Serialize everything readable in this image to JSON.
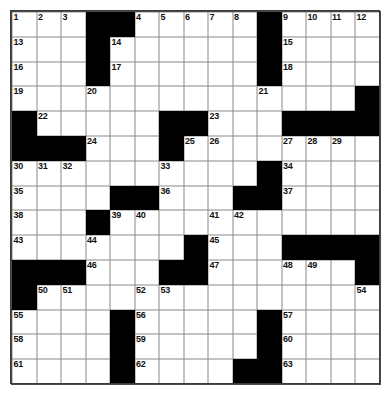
{
  "puzzle": {
    "title": "Crossword Puzzle Grid",
    "rows": 15,
    "cols": 15,
    "block_color": "#000000",
    "cell_color": "#ffffff",
    "line_color": "#8a8a8a",
    "number_color": "#111111",
    "grid": [
      [
        "o",
        "o",
        "o",
        "b",
        "b",
        "o",
        "o",
        "o",
        "o",
        "o",
        "b",
        "o",
        "o",
        "o",
        "o"
      ],
      [
        "o",
        "o",
        "o",
        "b",
        "o",
        "o",
        "o",
        "o",
        "o",
        "o",
        "b",
        "o",
        "o",
        "o",
        "o"
      ],
      [
        "o",
        "o",
        "o",
        "b",
        "o",
        "o",
        "o",
        "o",
        "o",
        "o",
        "b",
        "o",
        "o",
        "o",
        "o"
      ],
      [
        "o",
        "o",
        "o",
        "o",
        "o",
        "o",
        "o",
        "o",
        "o",
        "o",
        "o",
        "o",
        "o",
        "o",
        "b"
      ],
      [
        "b",
        "o",
        "o",
        "o",
        "o",
        "o",
        "b",
        "b",
        "o",
        "o",
        "o",
        "b",
        "b",
        "b",
        "b"
      ],
      [
        "b",
        "b",
        "b",
        "o",
        "o",
        "o",
        "b",
        "o",
        "o",
        "o",
        "o",
        "o",
        "o",
        "o",
        "o"
      ],
      [
        "o",
        "o",
        "o",
        "o",
        "o",
        "o",
        "o",
        "o",
        "o",
        "o",
        "b",
        "o",
        "o",
        "o",
        "o"
      ],
      [
        "o",
        "o",
        "o",
        "o",
        "b",
        "b",
        "o",
        "o",
        "o",
        "b",
        "b",
        "o",
        "o",
        "o",
        "o"
      ],
      [
        "o",
        "o",
        "o",
        "b",
        "o",
        "o",
        "o",
        "o",
        "o",
        "o",
        "o",
        "o",
        "o",
        "o",
        "o"
      ],
      [
        "o",
        "o",
        "o",
        "o",
        "o",
        "o",
        "o",
        "b",
        "o",
        "o",
        "o",
        "b",
        "b",
        "b",
        "b"
      ],
      [
        "b",
        "b",
        "b",
        "o",
        "o",
        "o",
        "b",
        "b",
        "o",
        "o",
        "o",
        "o",
        "o",
        "o",
        "b"
      ],
      [
        "b",
        "o",
        "o",
        "o",
        "o",
        "o",
        "o",
        "o",
        "o",
        "o",
        "o",
        "o",
        "o",
        "o",
        "o"
      ],
      [
        "o",
        "o",
        "o",
        "o",
        "b",
        "o",
        "o",
        "o",
        "o",
        "o",
        "b",
        "o",
        "o",
        "o",
        "o"
      ],
      [
        "o",
        "o",
        "o",
        "o",
        "b",
        "o",
        "o",
        "o",
        "o",
        "o",
        "b",
        "o",
        "o",
        "o",
        "o"
      ],
      [
        "o",
        "o",
        "o",
        "o",
        "b",
        "o",
        "o",
        "o",
        "o",
        "b",
        "b",
        "o",
        "o",
        "o",
        "o"
      ]
    ],
    "numbers": [
      {
        "row": 0,
        "col": 0,
        "n": "1"
      },
      {
        "row": 0,
        "col": 1,
        "n": "2"
      },
      {
        "row": 0,
        "col": 2,
        "n": "3"
      },
      {
        "row": 0,
        "col": 5,
        "n": "4"
      },
      {
        "row": 0,
        "col": 6,
        "n": "5"
      },
      {
        "row": 0,
        "col": 7,
        "n": "6"
      },
      {
        "row": 0,
        "col": 8,
        "n": "7"
      },
      {
        "row": 0,
        "col": 9,
        "n": "8"
      },
      {
        "row": 0,
        "col": 11,
        "n": "9"
      },
      {
        "row": 0,
        "col": 12,
        "n": "10"
      },
      {
        "row": 0,
        "col": 13,
        "n": "11"
      },
      {
        "row": 0,
        "col": 14,
        "n": "12"
      },
      {
        "row": 1,
        "col": 0,
        "n": "13"
      },
      {
        "row": 1,
        "col": 4,
        "n": "14"
      },
      {
        "row": 1,
        "col": 11,
        "n": "15"
      },
      {
        "row": 2,
        "col": 0,
        "n": "16"
      },
      {
        "row": 2,
        "col": 4,
        "n": "17"
      },
      {
        "row": 2,
        "col": 11,
        "n": "18"
      },
      {
        "row": 3,
        "col": 0,
        "n": "19"
      },
      {
        "row": 3,
        "col": 3,
        "n": "20"
      },
      {
        "row": 3,
        "col": 10,
        "n": "21"
      },
      {
        "row": 4,
        "col": 1,
        "n": "22"
      },
      {
        "row": 4,
        "col": 8,
        "n": "23"
      },
      {
        "row": 5,
        "col": 3,
        "n": "24"
      },
      {
        "row": 5,
        "col": 7,
        "n": "25"
      },
      {
        "row": 5,
        "col": 8,
        "n": "26"
      },
      {
        "row": 5,
        "col": 11,
        "n": "27"
      },
      {
        "row": 5,
        "col": 12,
        "n": "28"
      },
      {
        "row": 5,
        "col": 13,
        "n": "29"
      },
      {
        "row": 6,
        "col": 0,
        "n": "30"
      },
      {
        "row": 6,
        "col": 1,
        "n": "31"
      },
      {
        "row": 6,
        "col": 2,
        "n": "32"
      },
      {
        "row": 6,
        "col": 6,
        "n": "33"
      },
      {
        "row": 6,
        "col": 11,
        "n": "34"
      },
      {
        "row": 7,
        "col": 0,
        "n": "35"
      },
      {
        "row": 7,
        "col": 6,
        "n": "36"
      },
      {
        "row": 7,
        "col": 11,
        "n": "37"
      },
      {
        "row": 8,
        "col": 0,
        "n": "38"
      },
      {
        "row": 8,
        "col": 4,
        "n": "39"
      },
      {
        "row": 8,
        "col": 5,
        "n": "40"
      },
      {
        "row": 8,
        "col": 8,
        "n": "41"
      },
      {
        "row": 8,
        "col": 9,
        "n": "42"
      },
      {
        "row": 9,
        "col": 0,
        "n": "43"
      },
      {
        "row": 9,
        "col": 3,
        "n": "44"
      },
      {
        "row": 9,
        "col": 8,
        "n": "45"
      },
      {
        "row": 10,
        "col": 3,
        "n": "46"
      },
      {
        "row": 10,
        "col": 8,
        "n": "47"
      },
      {
        "row": 10,
        "col": 11,
        "n": "48"
      },
      {
        "row": 10,
        "col": 12,
        "n": "49"
      },
      {
        "row": 11,
        "col": 1,
        "n": "50"
      },
      {
        "row": 11,
        "col": 2,
        "n": "51"
      },
      {
        "row": 11,
        "col": 5,
        "n": "52"
      },
      {
        "row": 11,
        "col": 6,
        "n": "53"
      },
      {
        "row": 11,
        "col": 14,
        "n": "54"
      },
      {
        "row": 12,
        "col": 0,
        "n": "55"
      },
      {
        "row": 12,
        "col": 5,
        "n": "56"
      },
      {
        "row": 12,
        "col": 11,
        "n": "57"
      },
      {
        "row": 13,
        "col": 0,
        "n": "58"
      },
      {
        "row": 13,
        "col": 5,
        "n": "59"
      },
      {
        "row": 13,
        "col": 11,
        "n": "60"
      },
      {
        "row": 14,
        "col": 0,
        "n": "61"
      },
      {
        "row": 14,
        "col": 5,
        "n": "62"
      },
      {
        "row": 14,
        "col": 11,
        "n": "63"
      }
    ]
  }
}
